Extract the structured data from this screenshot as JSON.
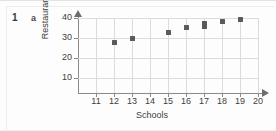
{
  "page": {
    "question_number": "1",
    "question_part": "a"
  },
  "chart_data": {
    "type": "scatter",
    "title": "",
    "xlabel": "Schools",
    "ylabel": "Restaurants",
    "xlim": [
      10,
      20
    ],
    "ylim": [
      0,
      42
    ],
    "xticks": [
      11,
      12,
      13,
      14,
      15,
      16,
      17,
      18,
      19,
      20
    ],
    "xtick_labels": [
      "11",
      "12",
      "13",
      "14",
      "15",
      "16",
      "17",
      "18",
      "19",
      "20"
    ],
    "yticks": [
      10,
      20,
      30,
      40
    ],
    "ytick_labels": [
      "10",
      "20",
      "30",
      "40"
    ],
    "grid": true,
    "legend": null,
    "marker": "square",
    "marker_color": "#5a5a5a",
    "grid_color": "#dcdcdc",
    "axis_color": "#8a8a8a",
    "points": [
      {
        "x": 12,
        "y": 28
      },
      {
        "x": 13,
        "y": 30
      },
      {
        "x": 15,
        "y": 33
      },
      {
        "x": 16,
        "y": 35.5
      },
      {
        "x": 17,
        "y": 36
      },
      {
        "x": 17,
        "y": 37.5
      },
      {
        "x": 18,
        "y": 38.5
      },
      {
        "x": 19,
        "y": 39.5
      }
    ]
  }
}
